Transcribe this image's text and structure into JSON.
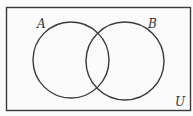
{
  "diagram": {
    "type": "venn",
    "universe_label": "U",
    "sets": [
      {
        "label": "A"
      },
      {
        "label": "B"
      }
    ],
    "stroke_color": "#3a3a3a",
    "background": "#fbfbfb"
  }
}
